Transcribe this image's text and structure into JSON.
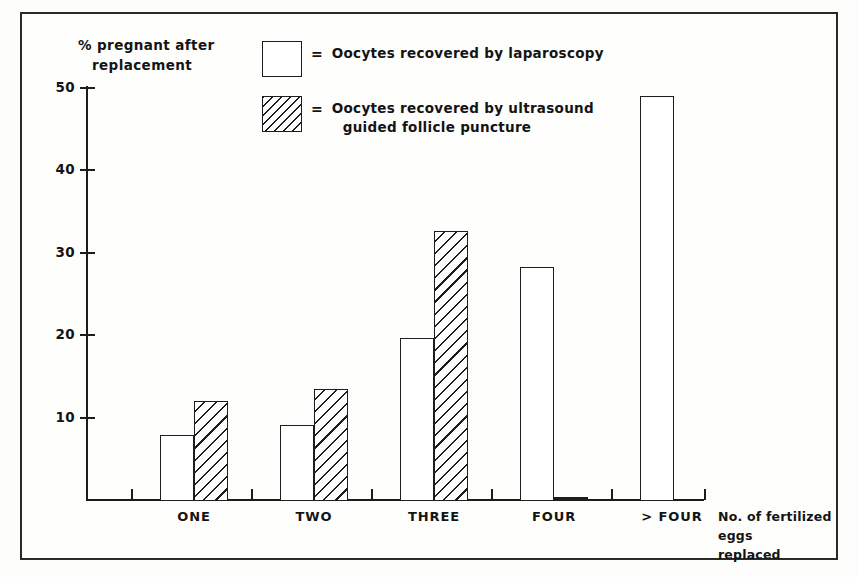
{
  "chart_data": {
    "type": "bar",
    "title": "",
    "ylabel_line1": "% pregnant after",
    "ylabel_line2": "replacement",
    "xlabel_line1": "No. of fertilized eggs",
    "xlabel_line2": "replaced",
    "categories": [
      "ONE",
      "TWO",
      "THREE",
      "FOUR",
      "> FOUR"
    ],
    "series": [
      {
        "name": "Oocytes recovered by laparoscopy",
        "pattern": "open",
        "values": [
          8.0,
          9.2,
          19.8,
          28.4,
          49.1
        ]
      },
      {
        "name": "Oocytes recovered by ultrasound guided follicle puncture",
        "pattern": "hatched",
        "values": [
          12.1,
          13.6,
          32.8,
          0.0,
          null
        ]
      }
    ],
    "ylim": [
      0,
      50
    ],
    "yticks": [
      10,
      20,
      30,
      40,
      50
    ],
    "ytick_labels": [
      "10",
      "20",
      "30",
      "40",
      "50"
    ],
    "grid": false,
    "legend_position": "top-right",
    "legend": [
      {
        "symbol": "open-square",
        "equals": "=",
        "line1": "Oocytes recovered by laparoscopy",
        "line2": ""
      },
      {
        "symbol": "hatched-square",
        "equals": "=",
        "line1": "Oocytes recovered by ultrasound",
        "line2": "guided follicle puncture"
      }
    ]
  },
  "colors": {
    "ink": "#1d1d1d",
    "paper": "#fefefd",
    "frame": "#2a2a2a"
  }
}
